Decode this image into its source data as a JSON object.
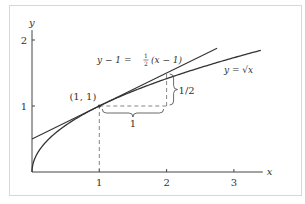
{
  "chart_data": {
    "type": "line",
    "title": "",
    "xlabel": "x",
    "ylabel": "y",
    "xlim": [
      0,
      3.4
    ],
    "ylim": [
      0,
      2.15
    ],
    "x_ticks": [
      {
        "value": 1,
        "label": "1"
      },
      {
        "value": 2,
        "label": "2"
      },
      {
        "value": 3,
        "label": "3"
      }
    ],
    "y_ticks": [
      {
        "value": 1,
        "label": "1"
      },
      {
        "value": 2,
        "label": "2"
      }
    ],
    "grid": false,
    "series": [
      {
        "name": "y = √x",
        "function": "sqrt(x)",
        "x_range": [
          0,
          3.4
        ],
        "label": "y = √x"
      },
      {
        "name": "tangent line",
        "function": "1 + 0.5*(x-1)",
        "x_range": [
          0,
          2.75
        ],
        "label": "y − 1 = ½(x − 1)"
      }
    ],
    "annotations": [
      {
        "type": "point",
        "x": 1,
        "y": 1,
        "label": "(1, 1)"
      },
      {
        "type": "dashed-vertical",
        "x": 1,
        "y_from": 0,
        "y_to": 1
      },
      {
        "type": "dashed-horizontal",
        "y": 1,
        "x_from": 1,
        "x_to": 2
      },
      {
        "type": "dashed-vertical",
        "x": 2,
        "y_from": 1,
        "y_to": 1.5
      },
      {
        "type": "brace-horizontal",
        "x_from": 1,
        "x_to": 2,
        "y": 1,
        "label": "1"
      },
      {
        "type": "brace-vertical",
        "x": 2,
        "y_from": 1,
        "y_to": 1.5,
        "label": "1/2"
      }
    ],
    "labels": {
      "tangent_lhs": "y − 1 = ",
      "tangent_frac_num": "1",
      "tangent_frac_den": "2",
      "tangent_rhs": "(x − 1)",
      "curve": "y = √x",
      "point": "(1, 1)",
      "run": "1",
      "rise": "1/2"
    }
  }
}
